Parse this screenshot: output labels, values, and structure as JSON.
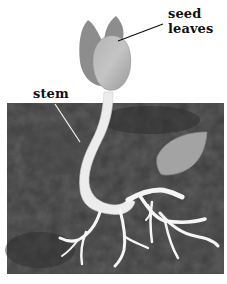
{
  "diagram": {
    "labels": {
      "seed_leaves_line1": "seed",
      "seed_leaves_line2": "leaves",
      "stem": "stem"
    },
    "parts": [
      "seed leaves",
      "stem",
      "roots",
      "seed coat",
      "soil"
    ],
    "colors": {
      "background": "#ffffff",
      "soil": "#3a3a3a",
      "leaf_back": "#8a8a8a",
      "leaf_front": "#a9a9a9",
      "stem": "#ececec",
      "roots": "#f4f4f4",
      "seed_coat": "#9c9c9c",
      "label_line": "#111111"
    }
  }
}
